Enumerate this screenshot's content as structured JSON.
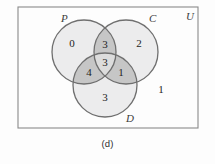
{
  "figure": {
    "caption": "(d)",
    "universe_label": "U",
    "outside_count": "1",
    "border_color": "#8a8a8a",
    "circle_stroke": "#6f6f6f",
    "fill_single": "#ececed",
    "fill_double": "#c6c6c6",
    "fill_triple": "#dcdcdc",
    "sets": [
      {
        "id": "P",
        "label": "P",
        "cx": 84,
        "cy": 52,
        "r": 32
      },
      {
        "id": "C",
        "label": "C",
        "cx": 126,
        "cy": 52,
        "r": 32
      },
      {
        "id": "D",
        "label": "D",
        "cx": 105,
        "cy": 85,
        "r": 32
      }
    ],
    "regions": [
      {
        "id": "P-only",
        "label": "0",
        "x": 72,
        "y": 44
      },
      {
        "id": "C-only",
        "label": "2",
        "x": 139,
        "y": 44
      },
      {
        "id": "D-only",
        "label": "3",
        "x": 105,
        "y": 98
      },
      {
        "id": "P-and-C",
        "label": "3",
        "x": 105,
        "y": 45
      },
      {
        "id": "P-and-D",
        "label": "4",
        "x": 89,
        "y": 73
      },
      {
        "id": "C-and-D",
        "label": "1",
        "x": 121,
        "y": 73
      },
      {
        "id": "P-C-D",
        "label": "3",
        "x": 105,
        "y": 63
      }
    ],
    "set_label_positions": [
      {
        "id": "P",
        "x": 61,
        "y": 22
      },
      {
        "id": "C",
        "x": 149,
        "y": 22
      },
      {
        "id": "D",
        "x": 126,
        "y": 122
      }
    ],
    "universe_label_position": {
      "x": 186,
      "y": 20
    },
    "outside_count_position": {
      "x": 161,
      "y": 90
    },
    "rect": {
      "x": 18,
      "y": 7,
      "width": 180,
      "height": 121
    }
  }
}
